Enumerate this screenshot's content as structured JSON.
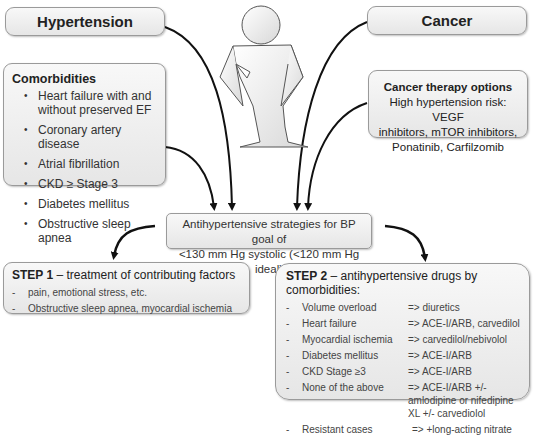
{
  "top_boxes": {
    "hypertension": "Hypertension",
    "cancer": "Cancer"
  },
  "comorbidities": {
    "title": "Comorbidities",
    "items": [
      "Heart failure with and without preserved EF",
      "Coronary artery disease",
      "Atrial fibrillation",
      "CKD ≥ Stage 3",
      "Diabetes mellitus",
      "Obstructive sleep apnea"
    ]
  },
  "cancer_therapy": {
    "title": "Cancer therapy options",
    "lines": [
      "High hypertension risk: VEGF",
      "inhibitors, mTOR inhibitors,",
      "Ponatinib, Carfilzomib"
    ]
  },
  "strategy": {
    "line1": "Antihypertensive strategies for BP goal of",
    "line2": "<130 mm Hg systolic (<120 mm Hg ideal)"
  },
  "step1": {
    "label": "STEP 1",
    "title_rest": " – treatment of contributing factors",
    "items": [
      "pain, emotional stress, etc.",
      "Obstructive sleep apnea, myocardial ischemia"
    ]
  },
  "step2": {
    "label": "STEP 2",
    "title_rest": " – antihypertensive drugs by comorbidities:",
    "rows": [
      {
        "condition": "Volume overload",
        "drug": "=> diuretics"
      },
      {
        "condition": "Heart failure",
        "drug": "=> ACE-I/ARB, carvedilol"
      },
      {
        "condition": "Myocardial ischemia",
        "drug": "=> carvedilol/nebivolol"
      },
      {
        "condition": "Diabetes mellitus",
        "drug": "=> ACE-I/ARB"
      },
      {
        "condition": "CKD Stage ≥3",
        "drug": "=> ACE-I/ARB"
      },
      {
        "condition": "None of the above",
        "drug": "=> ACE-I/ARB +/- amlodipine or nifedipine XL +/- carvediolol"
      },
      {
        "condition": "Resistant cases",
        "drug": "=> +long-acting nitrate"
      }
    ]
  },
  "icons": {
    "person": "person-figure-icon",
    "arrow": "curved-arrow-icon"
  },
  "colors": {
    "box_fill_top": "#f8f8f8",
    "box_fill_bottom": "#e6e6e6",
    "box_border": "#9a9a9a",
    "arrow": "#111111"
  }
}
